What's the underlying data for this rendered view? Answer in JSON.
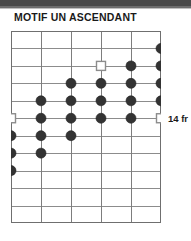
{
  "title": "MOTIF UN ASCENDANT",
  "colors": {
    "band": "#4a4a4a",
    "grid": "#8c8c8c",
    "marker_filled": "#333333",
    "marker_open_fill": "#ffffff",
    "text": "#1a1a1a"
  },
  "fretboard": {
    "strings": 6,
    "frets": 11,
    "string_spacing_px": 30,
    "fret_spacing_px": 17.45,
    "position_label": "14 fr",
    "position_label_fret_row": 6,
    "string_labels": [
      "1",
      "2",
      "3",
      "4",
      "5",
      "6"
    ],
    "markers": [
      {
        "fret": 1,
        "string": 6,
        "type": "filled"
      },
      {
        "fret": 2,
        "string": 4,
        "type": "open"
      },
      {
        "fret": 2,
        "string": 5,
        "type": "filled"
      },
      {
        "fret": 2,
        "string": 6,
        "type": "filled"
      },
      {
        "fret": 3,
        "string": 3,
        "type": "filled"
      },
      {
        "fret": 3,
        "string": 4,
        "type": "filled"
      },
      {
        "fret": 3,
        "string": 5,
        "type": "filled"
      },
      {
        "fret": 3,
        "string": 6,
        "type": "filled"
      },
      {
        "fret": 4,
        "string": 2,
        "type": "filled"
      },
      {
        "fret": 4,
        "string": 3,
        "type": "filled"
      },
      {
        "fret": 4,
        "string": 4,
        "type": "filled"
      },
      {
        "fret": 4,
        "string": 5,
        "type": "filled"
      },
      {
        "fret": 4,
        "string": 6,
        "type": "filled"
      },
      {
        "fret": 5,
        "string": 1,
        "type": "open"
      },
      {
        "fret": 5,
        "string": 2,
        "type": "filled"
      },
      {
        "fret": 5,
        "string": 3,
        "type": "filled"
      },
      {
        "fret": 5,
        "string": 4,
        "type": "filled"
      },
      {
        "fret": 5,
        "string": 5,
        "type": "filled"
      },
      {
        "fret": 5,
        "string": 6,
        "type": "open"
      },
      {
        "fret": 6,
        "string": 1,
        "type": "filled"
      },
      {
        "fret": 6,
        "string": 2,
        "type": "filled"
      },
      {
        "fret": 6,
        "string": 3,
        "type": "filled"
      },
      {
        "fret": 7,
        "string": 1,
        "type": "filled"
      },
      {
        "fret": 7,
        "string": 2,
        "type": "filled"
      },
      {
        "fret": 8,
        "string": 1,
        "type": "filled"
      }
    ]
  }
}
